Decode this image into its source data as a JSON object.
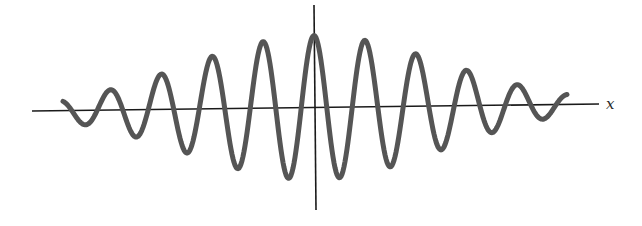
{
  "chart_data": {
    "type": "line",
    "title": "",
    "function": "y = A * exp(-x^2 / (2*sigma^2)) * cos(2*pi*x / period)",
    "xlabel": "x",
    "ylabel": "",
    "grid": false,
    "legend": null,
    "params": {
      "center_px": 314,
      "baseline_px": 108,
      "amplitude_px": 72,
      "sigma_px": 128,
      "period_px": 51,
      "x_start_px": 63,
      "x_end_px": 567
    },
    "peaks_px": [
      {
        "x": 162,
        "y": 69
      },
      {
        "x": 212,
        "y": 52
      },
      {
        "x": 263,
        "y": 41
      },
      {
        "x": 313,
        "y": 36
      },
      {
        "x": 365,
        "y": 40
      },
      {
        "x": 416,
        "y": 50
      },
      {
        "x": 467,
        "y": 65
      },
      {
        "x": 518,
        "y": 84
      }
    ],
    "troughs_px": [
      {
        "x": 88,
        "y": 121
      },
      {
        "x": 139,
        "y": 143
      },
      {
        "x": 189,
        "y": 159
      },
      {
        "x": 240,
        "y": 171
      },
      {
        "x": 290,
        "y": 177
      },
      {
        "x": 340,
        "y": 175
      },
      {
        "x": 391,
        "y": 169
      },
      {
        "x": 442,
        "y": 157
      },
      {
        "x": 492,
        "y": 138
      },
      {
        "x": 543,
        "y": 117
      }
    ],
    "axes": {
      "x_axis": {
        "x1": 32,
        "y1": 111,
        "x2": 599,
        "y2": 104
      },
      "y_axis": {
        "x1": 314,
        "y1": 5,
        "x2": 316,
        "y2": 210
      }
    }
  },
  "labels": {
    "x_axis": "x"
  },
  "colors": {
    "curve": "#555555",
    "axis": "#1a1a1a",
    "background": "#ffffff"
  }
}
